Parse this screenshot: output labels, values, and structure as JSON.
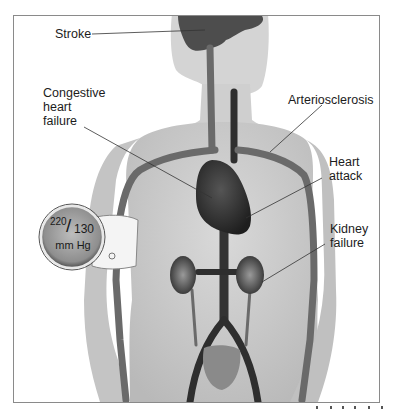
{
  "figure": {
    "labels": {
      "stroke": "Stroke",
      "chf_line1": "Congestive",
      "chf_line2": "heart",
      "chf_line3": "failure",
      "arteriosclerosis": "Arteriosclerosis",
      "heart_attack_line1": "Heart",
      "heart_attack_line2": "attack",
      "kidney_line1": "Kidney",
      "kidney_line2": "failure"
    },
    "gauge": {
      "systolic": "220",
      "slash": "/",
      "diastolic": "130",
      "unit": "mm Hg"
    },
    "colors": {
      "skin": "#cfcfcf",
      "vessel": "#5a5a5a",
      "organ": "#3a3a3a",
      "frame": "#8a8a8a",
      "text": "#1c1c1c"
    }
  }
}
